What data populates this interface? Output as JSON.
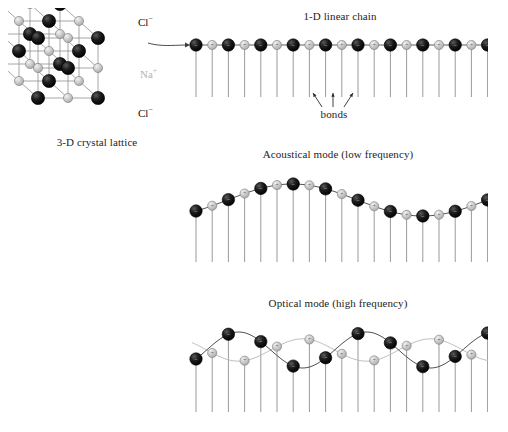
{
  "figure": {
    "background": "#ffffff"
  },
  "colors": {
    "anion_black": "#0d0d0d",
    "cation_gray": "#c0c0c0",
    "cation_gray_edge": "#8a8a8a",
    "bond_line": "#4a4a4a",
    "stem_line": "#6e6e6e",
    "text": "#1d1d1d",
    "na_label": "#b3b3b3",
    "light_wave": "#bdbdbd"
  },
  "panels": {
    "lattice": {
      "caption": "3-D crystal lattice",
      "caption_x": 97,
      "caption_y": 143,
      "labels": [
        {
          "name": "cl-top",
          "text": "Cl",
          "charge": "−",
          "x": 138,
          "y": 14,
          "tone": "cl"
        },
        {
          "name": "na-middle",
          "text": "Na",
          "charge": "+",
          "x": 140,
          "y": 66,
          "tone": "na"
        },
        {
          "name": "cl-bottom",
          "text": "Cl",
          "charge": "−",
          "x": 138,
          "y": 105,
          "tone": "cl"
        }
      ],
      "grid": {
        "nx": 3,
        "ny": 3,
        "nz": 3
      },
      "ion_legend": [
        {
          "species": "Cl−",
          "color": "#0d0d0d",
          "radius": 7
        },
        {
          "species": "Na+",
          "color": "#c0c0c0",
          "radius": 5
        }
      ]
    },
    "chain": {
      "title": "1-D linear chain",
      "title_x": 340,
      "title_y": 16,
      "baseline_y": 45,
      "atom_count": 19,
      "start_x": 196,
      "spacing": 16.2,
      "stem_length": 52,
      "bonds_label": "bonds",
      "bonds_label_x": 334,
      "bonds_label_y": 113,
      "bond_arrows": [
        {
          "tip_x": 313,
          "tip_y": 93,
          "tail_x": 322,
          "tail_y": 107
        },
        {
          "tip_x": 333,
          "tip_y": 93,
          "tail_x": 333,
          "tail_y": 107
        },
        {
          "tip_x": 353,
          "tip_y": 93,
          "tail_x": 344,
          "tail_y": 107
        }
      ],
      "pointer_arrow": {
        "from_x": 150,
        "from_y": 34,
        "to_x": 190,
        "to_y": 45
      }
    },
    "acoustical": {
      "title": "Acoustical mode (low frequency)",
      "title_x": 338,
      "title_y": 154,
      "baseline_y": 200,
      "amplitude": 16,
      "wavelength": 260,
      "phase_deg": 250,
      "atom_count": 19,
      "start_x": 196,
      "spacing": 16.2,
      "stem_bottom_y": 262,
      "description": "Both sublattices displace in phase on a single long-wavelength sine wave."
    },
    "optical": {
      "title": "Optical mode (high frequency)",
      "title_x": 338,
      "title_y": 303,
      "baseline_y": 350,
      "amplitude": 18,
      "wavelength": 128,
      "phase_deg": 195,
      "atom_count": 19,
      "start_x": 196,
      "spacing": 16.2,
      "stem_bottom_y": 412,
      "description": "The two sublattices oscillate 180 degrees out of phase; black wave and gray wave are opposed."
    }
  }
}
